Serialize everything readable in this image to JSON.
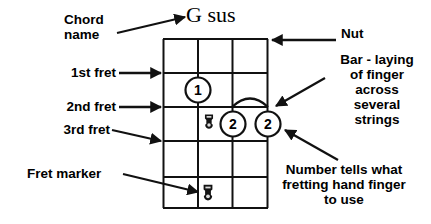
{
  "diagram": {
    "kind": "guitar-chord-diagram",
    "chord_name": "G sus",
    "ink_color": "#111111",
    "background_color": "#ffffff",
    "fretboard": {
      "strings": 4,
      "frets": 5,
      "nut_label": "Nut"
    },
    "fret_labels": [
      {
        "text": "1st fret"
      },
      {
        "text": "2nd fret"
      },
      {
        "text": "3rd fret"
      }
    ],
    "callouts": {
      "chord_name_label": "Chord\nname",
      "nut": "Nut",
      "bar": "Bar - laying\nof finger\nacross\nseveral\nstrings",
      "number": "Number tells what\nfretting hand finger\nto use",
      "fret_marker": "Fret marker"
    },
    "finger_dots": [
      {
        "finger": "1",
        "string": 2,
        "fret": 2
      },
      {
        "finger": "2",
        "string": 3,
        "fret": 3
      },
      {
        "finger": "2",
        "string": 4,
        "fret": 3
      }
    ],
    "fret_markers": [
      {
        "string": 2,
        "fret": 3
      },
      {
        "string": 2,
        "fret": 5
      }
    ],
    "bar": {
      "from_string": 3,
      "to_string": 4,
      "fret": 3
    }
  }
}
